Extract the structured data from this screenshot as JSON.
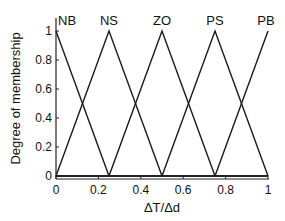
{
  "chart_data": {
    "type": "line",
    "title": "",
    "xlabel": "ΔT/Δd",
    "ylabel": "Degree of membership",
    "xlim": [
      0,
      1
    ],
    "ylim": [
      0,
      1.1
    ],
    "grid": false,
    "legend": "none",
    "x_ticks": [
      "0",
      "0.2",
      "0.4",
      "0.6",
      "0.8",
      "1"
    ],
    "y_ticks": [
      "0",
      "0.2",
      "0.4",
      "0.6",
      "0.8",
      "1"
    ],
    "series": [
      {
        "name": "NB",
        "x": [
          0,
          0.25
        ],
        "y": [
          1,
          0
        ]
      },
      {
        "name": "NS",
        "x": [
          0,
          0.25,
          0.5
        ],
        "y": [
          0,
          1,
          0
        ]
      },
      {
        "name": "ZO",
        "x": [
          0.25,
          0.5,
          0.75
        ],
        "y": [
          0,
          1,
          0
        ]
      },
      {
        "name": "PS",
        "x": [
          0.5,
          0.75,
          1
        ],
        "y": [
          0,
          1,
          0
        ]
      },
      {
        "name": "PB",
        "x": [
          0.75,
          1
        ],
        "y": [
          0,
          1
        ]
      }
    ],
    "annotations": [
      {
        "text": "NB",
        "x": 0.0
      },
      {
        "text": "NS",
        "x": 0.25
      },
      {
        "text": "ZO",
        "x": 0.5
      },
      {
        "text": "PS",
        "x": 0.75
      },
      {
        "text": "PB",
        "x": 1.0
      }
    ]
  }
}
